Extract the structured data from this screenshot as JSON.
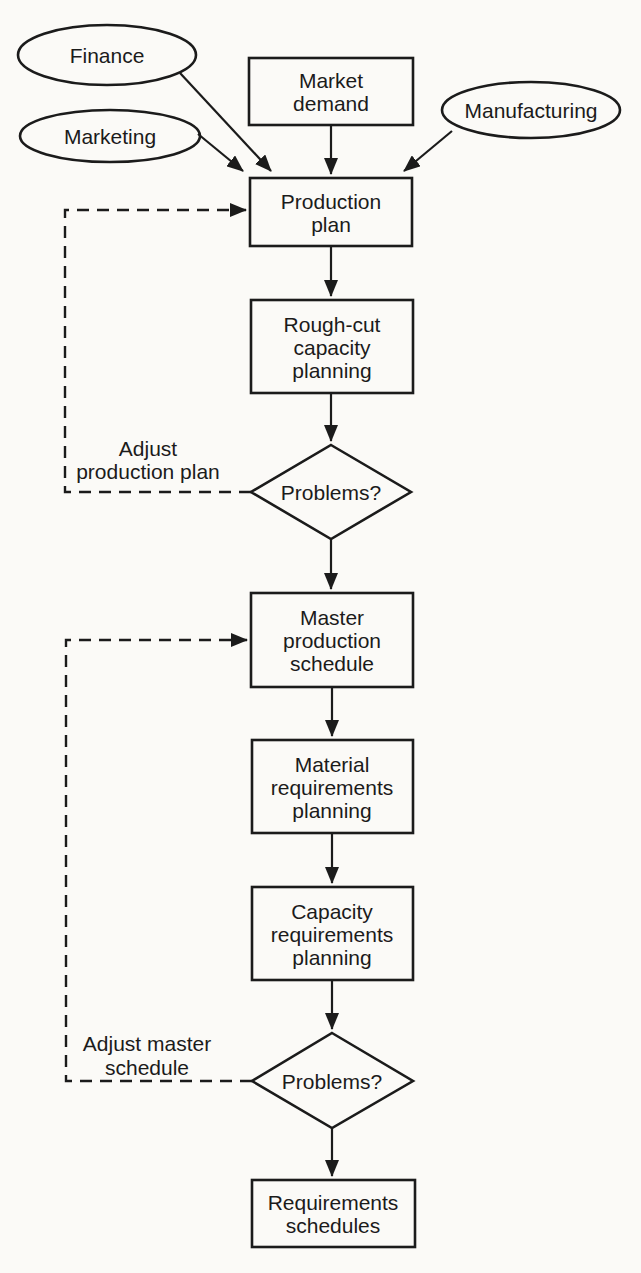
{
  "diagram_title": "Production planning flowchart",
  "colors": {
    "ink": "#1b1b1b",
    "background": "#fbfaf7"
  },
  "ellipses": {
    "finance": {
      "label": "Finance"
    },
    "marketing": {
      "label": "Marketing"
    },
    "manufacturing": {
      "label": "Manufacturing"
    }
  },
  "boxes": {
    "market_demand": {
      "lines": [
        "Market",
        "demand"
      ]
    },
    "production_plan": {
      "lines": [
        "Production",
        "plan"
      ]
    },
    "rough_cut_capacity_planning": {
      "lines": [
        "Rough-cut",
        "capacity",
        "planning"
      ]
    },
    "master_production_schedule": {
      "lines": [
        "Master",
        "production",
        "schedule"
      ]
    },
    "material_requirements_planning": {
      "lines": [
        "Material",
        "requirements",
        "planning"
      ]
    },
    "capacity_requirements_planning": {
      "lines": [
        "Capacity",
        "requirements",
        "planning"
      ]
    },
    "requirements_schedules": {
      "lines": [
        "Requirements",
        "schedules"
      ]
    }
  },
  "decisions": {
    "problems_1": {
      "label": "Problems?"
    },
    "problems_2": {
      "label": "Problems?"
    }
  },
  "feedback": {
    "adjust_production_plan": {
      "lines": [
        "Adjust",
        "production plan"
      ]
    },
    "adjust_master_schedule": {
      "lines": [
        "Adjust master",
        "schedule"
      ]
    }
  }
}
